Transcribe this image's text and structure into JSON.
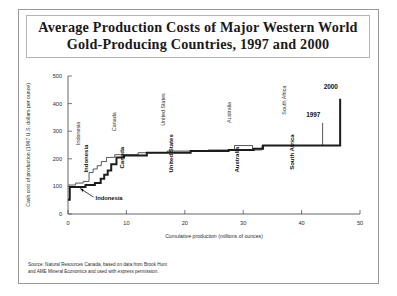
{
  "title": {
    "line1": "Average Production Costs of Major  Western World",
    "line2": "Gold-Producing Countries, 1997 and 2000"
  },
  "source": {
    "line1": "Source:  Natural Resources Canada, based on data from Brook Hunt",
    "line2": "and AME Mineral Economics and used with express permission."
  },
  "annotations": {
    "indonesia_callout": "Indonesia"
  },
  "chart_data": {
    "type": "line",
    "title": "Average Production Costs of Major  Western World Gold-Producing Countries, 1997 and 2000",
    "xlabel": "Cumulative production (millions of ounces)",
    "ylabel": "Cash cost of production (1997 U.S. dollars per ounce)",
    "xlim": [
      0,
      50
    ],
    "ylim": [
      0,
      500
    ],
    "xticks": [
      0,
      10,
      20,
      30,
      40,
      50
    ],
    "yticks": [
      0,
      100,
      200,
      300,
      400,
      500
    ],
    "xticklabels": [
      "0",
      "10",
      "20",
      "30",
      "40",
      "50"
    ],
    "yticklabels": [
      "0",
      "100",
      "200",
      "300",
      "400",
      "500"
    ],
    "grid": false,
    "legend_position": "inline-at-line-ends",
    "series": [
      {
        "name": "1997",
        "style": "thin",
        "points": [
          [
            0.0,
            105
          ],
          [
            1.3,
            105
          ],
          [
            1.3,
            112
          ],
          [
            2.6,
            112
          ],
          [
            2.6,
            118
          ],
          [
            3.6,
            118
          ],
          [
            3.6,
            150
          ],
          [
            4.3,
            150
          ],
          [
            4.3,
            163
          ],
          [
            5.0,
            163
          ],
          [
            5.0,
            175
          ],
          [
            5.7,
            175
          ],
          [
            5.7,
            190
          ],
          [
            6.6,
            190
          ],
          [
            6.6,
            205
          ],
          [
            8.0,
            205
          ],
          [
            8.0,
            215
          ],
          [
            12.0,
            215
          ],
          [
            12.0,
            222
          ],
          [
            17.0,
            222
          ],
          [
            17.0,
            228
          ],
          [
            24.0,
            228
          ],
          [
            24.0,
            232
          ],
          [
            28.5,
            232
          ],
          [
            28.5,
            248
          ],
          [
            31.6,
            248
          ],
          [
            31.6,
            232
          ],
          [
            33.2,
            232
          ],
          [
            33.2,
            248
          ],
          [
            43.6,
            248
          ],
          [
            43.6,
            330
          ]
        ]
      },
      {
        "name": "2000",
        "style": "thick",
        "points": [
          [
            0.0,
            52
          ],
          [
            0.3,
            52
          ],
          [
            0.3,
            98
          ],
          [
            3.0,
            98
          ],
          [
            3.0,
            105
          ],
          [
            4.6,
            105
          ],
          [
            4.6,
            112
          ],
          [
            5.6,
            112
          ],
          [
            5.6,
            128
          ],
          [
            6.2,
            128
          ],
          [
            6.2,
            142
          ],
          [
            6.8,
            142
          ],
          [
            6.8,
            158
          ],
          [
            7.4,
            158
          ],
          [
            7.4,
            180
          ],
          [
            8.3,
            180
          ],
          [
            8.3,
            205
          ],
          [
            9.6,
            205
          ],
          [
            9.6,
            212
          ],
          [
            13.5,
            212
          ],
          [
            13.5,
            222
          ],
          [
            21.0,
            222
          ],
          [
            21.0,
            228
          ],
          [
            27.5,
            228
          ],
          [
            27.5,
            232
          ],
          [
            31.8,
            232
          ],
          [
            31.8,
            236
          ],
          [
            33.4,
            236
          ],
          [
            33.4,
            248
          ],
          [
            46.6,
            248
          ],
          [
            46.6,
            418
          ]
        ]
      }
    ],
    "country_labels": [
      {
        "name": "Indonesia",
        "x": 2.3,
        "y_thin": 250,
        "y_bold": 150
      },
      {
        "name": "Canada",
        "x": 8.4,
        "y_thin": 300,
        "y_bold": 165
      },
      {
        "name": "United States",
        "x": 16.8,
        "y_thin": 320,
        "y_bold": 150
      },
      {
        "name": "Australia",
        "x": 28.0,
        "y_thin": 330,
        "y_bold": 150
      },
      {
        "name": "South Africa",
        "x": 37.5,
        "y_thin": 360,
        "y_bold": 160
      }
    ],
    "series_end_labels": [
      {
        "name": "1997",
        "x": 42.0,
        "y": 352
      },
      {
        "name": "2000",
        "x": 45.0,
        "y": 452
      }
    ]
  }
}
